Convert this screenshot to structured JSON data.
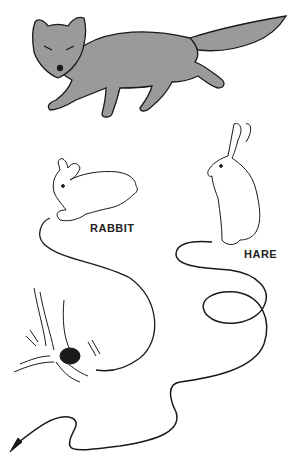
{
  "figure": {
    "subjects": [
      {
        "name": "fox",
        "label": ""
      },
      {
        "name": "rabbit",
        "label": "RABBIT"
      },
      {
        "name": "hare",
        "label": "HARE"
      }
    ],
    "elements": {
      "rabbit_trail": "short trail ending at burrow under tree stump",
      "hare_trail": "long looping trail ending in arrow at bottom left"
    },
    "colors": {
      "fox_fill": "#9a9a9a",
      "ink": "#1a1a1a",
      "background": "#ffffff"
    }
  }
}
